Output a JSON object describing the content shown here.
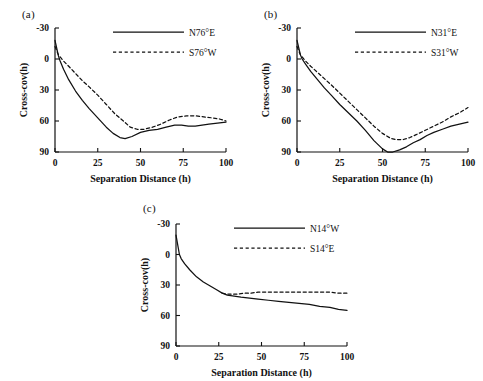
{
  "figure": {
    "panels": [
      {
        "label": "(a)",
        "xlabel": "Separation Distance (h)",
        "ylabel": "Cross-cov(h)",
        "legend": {
          "solid": "N76°E",
          "dashed": "S76°W"
        }
      },
      {
        "label": "(b)",
        "xlabel": "Separation Distance (h)",
        "ylabel": "Cross-cov(h)",
        "legend": {
          "solid": "N31°E",
          "dashed": "S31°W"
        }
      },
      {
        "label": "(c)",
        "xlabel": "Separation Distance (h)",
        "ylabel": "Cross-cov(h)",
        "legend": {
          "solid": "N14°W",
          "dashed": "S14°E"
        }
      }
    ],
    "xticks": [
      "0",
      "25",
      "50",
      "75",
      "100"
    ],
    "yticks": [
      "90",
      "60",
      "30",
      "0",
      "-30"
    ]
  },
  "chart_data": [
    {
      "type": "line",
      "title": "(a)",
      "xlabel": "Separation Distance (h)",
      "ylabel": "Cross-cov(h)",
      "xlim": [
        0,
        100
      ],
      "ylim": [
        -30,
        90
      ],
      "xticks": [
        0,
        25,
        50,
        75,
        100
      ],
      "yticks": [
        -30,
        0,
        30,
        60,
        90
      ],
      "grid": false,
      "legend_position": "top-right",
      "series": [
        {
          "name": "N76°E",
          "style": "solid",
          "x": [
            0,
            2,
            3,
            5,
            8,
            12,
            16,
            20,
            25,
            30,
            34,
            38,
            41,
            45,
            50,
            55,
            60,
            65,
            70,
            74,
            78,
            82,
            86,
            90,
            95,
            100
          ],
          "values": [
            78,
            63,
            58,
            50,
            40,
            29,
            20,
            12,
            3,
            -6,
            -12,
            -16,
            -17,
            -15,
            -11,
            -9,
            -8,
            -6,
            -4,
            -4,
            -5,
            -5,
            -4,
            -3,
            -2,
            -1
          ]
        },
        {
          "name": "S76°W",
          "style": "dashed",
          "x": [
            0,
            2,
            3,
            5,
            8,
            12,
            16,
            20,
            25,
            30,
            35,
            40,
            44,
            48,
            52,
            57,
            62,
            67,
            72,
            77,
            82,
            87,
            92,
            96,
            100
          ],
          "values": [
            72,
            64,
            62,
            58,
            53,
            46,
            39,
            33,
            25,
            16,
            7,
            0,
            -6,
            -8,
            -8,
            -6,
            -3,
            1,
            4,
            5,
            5,
            4,
            3,
            2,
            0
          ]
        }
      ]
    },
    {
      "type": "line",
      "title": "(b)",
      "xlabel": "Separation Distance (h)",
      "ylabel": "Cross-cov(h)",
      "xlim": [
        0,
        100
      ],
      "ylim": [
        -30,
        90
      ],
      "xticks": [
        0,
        25,
        50,
        75,
        100
      ],
      "yticks": [
        -30,
        0,
        30,
        60,
        90
      ],
      "grid": false,
      "legend_position": "top-right",
      "series": [
        {
          "name": "N31°E",
          "style": "solid",
          "x": [
            0,
            2,
            3,
            5,
            8,
            12,
            16,
            20,
            25,
            30,
            35,
            40,
            45,
            50,
            53,
            56,
            60,
            64,
            68,
            72,
            76,
            80,
            85,
            90,
            95,
            100
          ],
          "values": [
            78,
            64,
            60,
            55,
            48,
            40,
            32,
            25,
            16,
            8,
            0,
            -9,
            -19,
            -27,
            -30,
            -30,
            -28,
            -25,
            -21,
            -18,
            -14,
            -11,
            -8,
            -5,
            -3,
            -1
          ]
        },
        {
          "name": "S31°W",
          "style": "dashed",
          "x": [
            0,
            2,
            3,
            5,
            8,
            12,
            16,
            20,
            25,
            30,
            35,
            40,
            45,
            50,
            55,
            58,
            62,
            66,
            70,
            75,
            80,
            85,
            90,
            95,
            100
          ],
          "values": [
            72,
            64,
            62,
            58,
            53,
            47,
            41,
            35,
            27,
            19,
            11,
            3,
            -5,
            -12,
            -17,
            -18,
            -18,
            -16,
            -13,
            -9,
            -5,
            -1,
            4,
            8,
            13
          ]
        }
      ]
    },
    {
      "type": "line",
      "title": "(c)",
      "xlabel": "Separation Distance (h)",
      "ylabel": "Cross-cov(h)",
      "xlim": [
        0,
        100
      ],
      "ylim": [
        -30,
        90
      ],
      "xticks": [
        0,
        25,
        50,
        75,
        100
      ],
      "yticks": [
        -30,
        0,
        30,
        60,
        90
      ],
      "grid": false,
      "legend_position": "top-right",
      "series": [
        {
          "name": "N14°W",
          "style": "solid",
          "x": [
            0,
            2,
            3,
            5,
            8,
            12,
            16,
            20,
            24,
            27,
            30,
            34,
            38,
            43,
            48,
            54,
            60,
            66,
            72,
            78,
            84,
            90,
            95,
            100
          ],
          "values": [
            79,
            60,
            56,
            51,
            45,
            38,
            33,
            29,
            25,
            22,
            20,
            19,
            18,
            17,
            16,
            15,
            14,
            13,
            12,
            11,
            9,
            8,
            6,
            5
          ]
        },
        {
          "name": "S14°E",
          "style": "dashed",
          "x": [
            27,
            30,
            33,
            36,
            40,
            44,
            48,
            52,
            56,
            60,
            65,
            70,
            75,
            80,
            85,
            90,
            95,
            100
          ],
          "values": [
            22,
            21,
            21,
            21,
            22,
            22,
            23,
            23,
            23,
            23,
            23,
            23,
            23,
            23,
            23,
            23,
            22,
            22
          ]
        }
      ]
    }
  ]
}
